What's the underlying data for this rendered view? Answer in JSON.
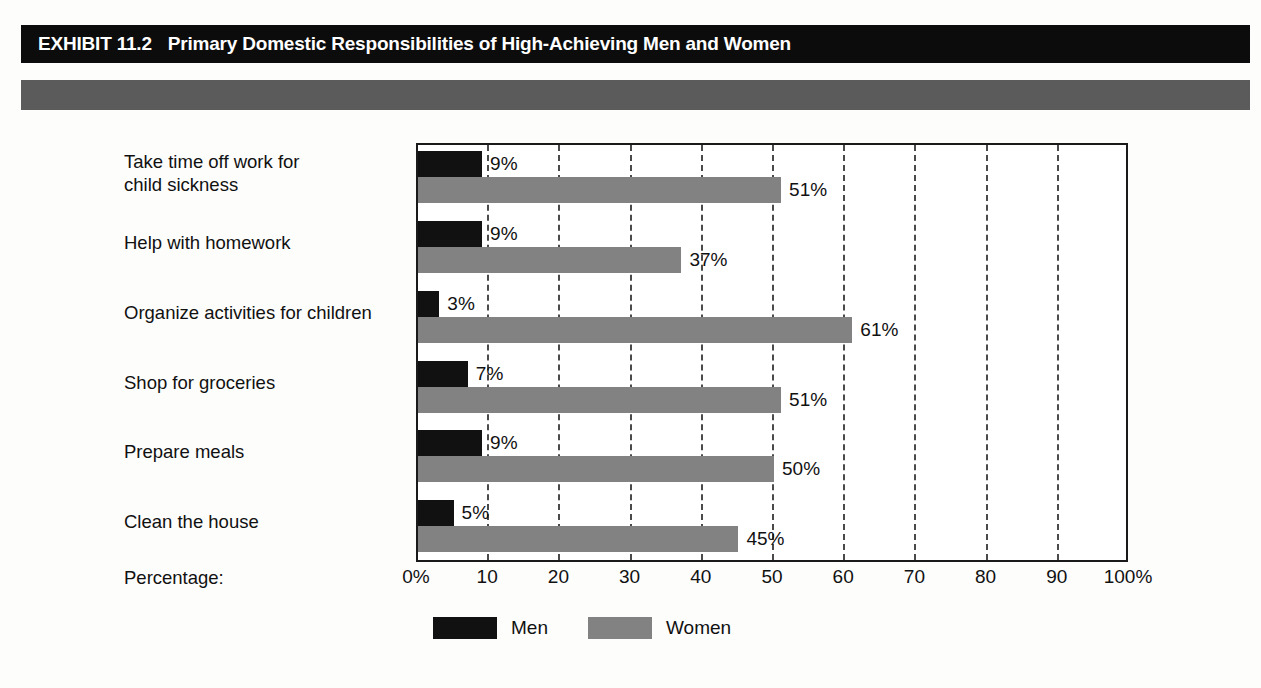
{
  "header": {
    "exhibit_label": "EXHIBIT 11.2",
    "title": "Primary Domestic Responsibilities of High-Achieving Men and Women"
  },
  "axis_caption": "Percentage:",
  "legend": {
    "items": [
      {
        "label": "Men",
        "color": "#111111"
      },
      {
        "label": "Women",
        "color": "#828282"
      }
    ]
  },
  "chart_data": {
    "type": "bar",
    "orientation": "horizontal",
    "title": "Primary Domestic Responsibilities of High-Achieving Men and Women",
    "xlabel": "Percentage:",
    "ylabel": "",
    "xlim": [
      0,
      100
    ],
    "grid": true,
    "legend_position": "bottom",
    "tick_labels": [
      "0%",
      "10",
      "20",
      "30",
      "40",
      "50",
      "60",
      "70",
      "80",
      "90",
      "100%"
    ],
    "tick_values": [
      0,
      10,
      20,
      30,
      40,
      50,
      60,
      70,
      80,
      90,
      100
    ],
    "categories": [
      "Take time off work for child sickness",
      "Help with homework",
      "Organize activities for children",
      "Shop for groceries",
      "Prepare meals",
      "Clean the house"
    ],
    "series": [
      {
        "name": "Men",
        "color": "#111111",
        "values": [
          9,
          9,
          3,
          7,
          9,
          5
        ]
      },
      {
        "name": "Women",
        "color": "#828282",
        "values": [
          51,
          37,
          61,
          51,
          50,
          45
        ]
      }
    ],
    "data_labels": {
      "Men": [
        "9%",
        "9%",
        "3%",
        "7%",
        "9%",
        "5%"
      ],
      "Women": [
        "51%",
        "37%",
        "61%",
        "51%",
        "50%",
        "45%"
      ]
    }
  },
  "category_lines": [
    [
      "Take time off work for",
      "child sickness"
    ],
    [
      "Help with homework"
    ],
    [
      "Organize activities for children"
    ],
    [
      "Shop for groceries"
    ],
    [
      "Prepare meals"
    ],
    [
      "Clean the house"
    ]
  ]
}
